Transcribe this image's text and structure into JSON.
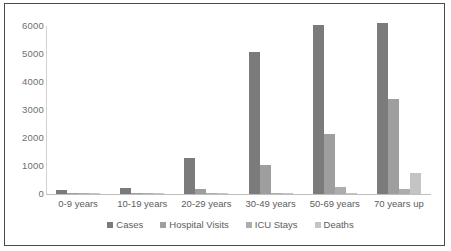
{
  "chart_data": {
    "type": "bar",
    "title": "",
    "xlabel": "",
    "ylabel": "",
    "ylim": [
      0,
      6000
    ],
    "yticks": [
      0,
      1000,
      2000,
      3000,
      4000,
      5000,
      6000
    ],
    "ytick_labels": [
      "0",
      "1000",
      "2000",
      "3000",
      "4000",
      "5000",
      "6000"
    ],
    "grid": false,
    "legend_position": "bottom",
    "categories": [
      "0-9 years",
      "10-19 years",
      "20-29 years",
      "30-49 years",
      "50-69 years",
      "70 years up"
    ],
    "series": [
      {
        "name": "Cases",
        "color": "#7b7b7b",
        "values": [
          140,
          230,
          1300,
          5080,
          6050,
          6100
        ]
      },
      {
        "name": "Hospital Visits",
        "color": "#9e9e9e",
        "values": [
          20,
          25,
          190,
          1050,
          2150,
          3380
        ]
      },
      {
        "name": "ICU Stays",
        "color": "#adadad",
        "values": [
          5,
          8,
          20,
          40,
          250,
          190
        ]
      },
      {
        "name": "Deaths",
        "color": "#c4c4c4",
        "values": [
          2,
          3,
          10,
          30,
          45,
          750
        ]
      }
    ]
  },
  "colors": {
    "frame_border": "#4a4a4a",
    "axis": "#bdbdbd",
    "tick_text": "#6e6e6e",
    "label_text": "#5d5d5d",
    "background": "#ffffff"
  }
}
